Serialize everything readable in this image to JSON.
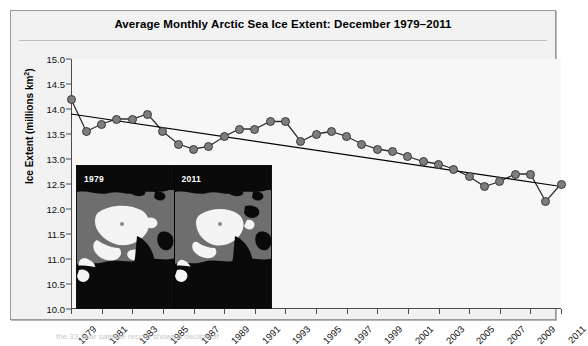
{
  "chart_data": {
    "type": "line",
    "title": "Average Monthly Arctic Sea Ice Extent: December 1979–2011",
    "xlabel": "",
    "ylabel": "Ice Extent (millions km²)",
    "ylim": [
      10.0,
      15.0
    ],
    "xlim": [
      1979,
      2011
    ],
    "grid": false,
    "legend": "none",
    "ytick_labels": [
      "15.0",
      "14.5",
      "14.0",
      "13.5",
      "13.0",
      "12.5",
      "12.0",
      "11.5",
      "11.0",
      "10.5",
      "10.0"
    ],
    "ytick_values": [
      15.0,
      14.5,
      14.0,
      13.5,
      13.0,
      12.5,
      12.0,
      11.5,
      11.0,
      10.5,
      10.0
    ],
    "xtick_labels": [
      "1979",
      "1981",
      "1983",
      "1985",
      "1987",
      "1989",
      "1991",
      "1993",
      "1995",
      "1997",
      "1999",
      "2001",
      "2003",
      "2005",
      "2007",
      "2009",
      "2011"
    ],
    "xtick_values": [
      1979,
      1981,
      1983,
      1985,
      1987,
      1989,
      1991,
      1993,
      1995,
      1997,
      1999,
      2001,
      2003,
      2005,
      2007,
      2009,
      2011
    ],
    "x": [
      1979,
      1980,
      1981,
      1982,
      1983,
      1984,
      1985,
      1986,
      1987,
      1988,
      1989,
      1990,
      1991,
      1992,
      1993,
      1994,
      1995,
      1996,
      1997,
      1998,
      1999,
      2000,
      2001,
      2002,
      2003,
      2004,
      2005,
      2006,
      2007,
      2008,
      2009,
      2010,
      2011
    ],
    "series": [
      {
        "name": "December sea ice extent",
        "marker": "circle",
        "values": [
          14.2,
          13.55,
          13.7,
          13.8,
          13.8,
          13.9,
          13.55,
          13.3,
          13.2,
          13.25,
          13.45,
          13.6,
          13.6,
          13.75,
          13.75,
          13.35,
          13.5,
          13.55,
          13.45,
          13.3,
          13.2,
          13.15,
          13.05,
          12.95,
          12.9,
          12.8,
          12.65,
          12.45,
          12.55,
          12.7,
          12.7,
          12.15,
          12.5
        ]
      }
    ],
    "trendline": {
      "name": "linear trend",
      "start": {
        "x": 1979,
        "y": 13.9
      },
      "end": {
        "x": 2011,
        "y": 12.45
      }
    }
  },
  "inset": {
    "panels": [
      {
        "year": "1979",
        "description": "Arctic sea ice concentration map, December 1979"
      },
      {
        "year": "2011",
        "description": "Arctic sea ice concentration map, December 2011"
      }
    ]
  },
  "caption": {
    "text": "the 33-year satellite record shows a decline of"
  }
}
